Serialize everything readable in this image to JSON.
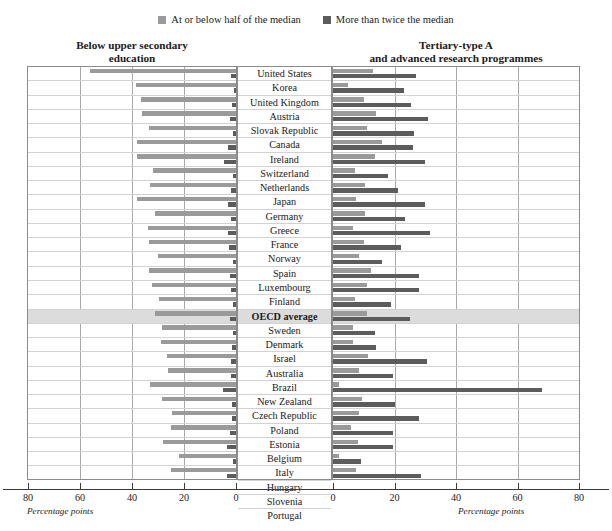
{
  "legend": {
    "items": [
      {
        "label": "At or below half of the median",
        "color": "#9a9a9a",
        "swatch_name": "legend-swatch-light"
      },
      {
        "label": "More than twice the median",
        "color": "#5c5c5c",
        "swatch_name": "legend-swatch-dark"
      }
    ]
  },
  "panels": {
    "left": {
      "title_line1": "Below upper secondary",
      "title_line2": "education",
      "axis_caption": "Percentage points",
      "ticks": [
        "80",
        "60",
        "40",
        "20",
        "0"
      ]
    },
    "right": {
      "title_line1": "Tertiary-type A",
      "title_line2": "and advanced research programmes",
      "axis_caption": "Percentage points",
      "ticks": [
        "0",
        "20",
        "40",
        "60",
        "80"
      ]
    }
  },
  "chart_data": {
    "type": "bar",
    "orientation": "horizontal",
    "layout": "diverging-paired-panels",
    "title": "",
    "xlabel": "Percentage points",
    "ylabel": "",
    "xlim": [
      0,
      80
    ],
    "grid": true,
    "legend_position": "top-center",
    "panel_labels": [
      "Below upper secondary education",
      "Tertiary-type A and advanced research programmes"
    ],
    "series": [
      {
        "name": "At or below half of the median",
        "color": "#9a9a9a"
      },
      {
        "name": "More than twice the median",
        "color": "#5c5c5c"
      }
    ],
    "categories": [
      "United States",
      "Korea",
      "United Kingdom",
      "Austria",
      "Slovak Republic",
      "Canada",
      "Ireland",
      "Switzerland",
      "Netherlands",
      "Japan",
      "Germany",
      "Greece",
      "France",
      "Norway",
      "Spain",
      "Luxembourg",
      "Finland",
      "OECD average",
      "Sweden",
      "Denmark",
      "Israel",
      "Australia",
      "Brazil",
      "New Zealand",
      "Czech Republic",
      "Poland",
      "Estonia",
      "Belgium",
      "Italy",
      "Hungary",
      "Slovenia",
      "Portugal"
    ],
    "highlight_category": "OECD average",
    "rows": [
      {
        "country": "United States",
        "left_low": 56.0,
        "left_high": 2.0,
        "right_low": 13.0,
        "right_high": 27.0
      },
      {
        "country": "Korea",
        "left_low": 38.5,
        "left_high": 0.8,
        "right_low": 5.0,
        "right_high": 23.0
      },
      {
        "country": "United Kingdom",
        "left_low": 36.5,
        "left_high": 1.5,
        "right_low": 10.0,
        "right_high": 25.5
      },
      {
        "country": "Austria",
        "left_low": 36.0,
        "left_high": 2.2,
        "right_low": 14.0,
        "right_high": 31.0
      },
      {
        "country": "Slovak Republic",
        "left_low": 33.5,
        "left_high": 1.0,
        "right_low": 11.0,
        "right_high": 26.5
      },
      {
        "country": "Canada",
        "left_low": 38.0,
        "left_high": 3.2,
        "right_low": 16.0,
        "right_high": 26.0
      },
      {
        "country": "Ireland",
        "left_low": 38.0,
        "left_high": 4.5,
        "right_low": 13.5,
        "right_high": 30.0
      },
      {
        "country": "Switzerland",
        "left_low": 32.0,
        "left_high": 1.2,
        "right_low": 7.0,
        "right_high": 18.0
      },
      {
        "country": "Netherlands",
        "left_low": 33.0,
        "left_high": 2.0,
        "right_low": 10.5,
        "right_high": 21.0
      },
      {
        "country": "Japan",
        "left_low": 38.0,
        "left_high": 3.0,
        "right_low": 7.5,
        "right_high": 30.0
      },
      {
        "country": "Germany",
        "left_low": 31.0,
        "left_high": 2.0,
        "right_low": 10.5,
        "right_high": 23.5
      },
      {
        "country": "Greece",
        "left_low": 34.0,
        "left_high": 3.0,
        "right_low": 6.5,
        "right_high": 31.5
      },
      {
        "country": "France",
        "left_low": 33.5,
        "left_high": 2.8,
        "right_low": 10.0,
        "right_high": 22.0
      },
      {
        "country": "Norway",
        "left_low": 30.0,
        "left_high": 1.0,
        "right_low": 8.5,
        "right_high": 16.0
      },
      {
        "country": "Spain",
        "left_low": 33.5,
        "left_high": 2.5,
        "right_low": 12.5,
        "right_high": 28.0
      },
      {
        "country": "Luxembourg",
        "left_low": 32.5,
        "left_high": 2.0,
        "right_low": 11.0,
        "right_high": 28.0
      },
      {
        "country": "Finland",
        "left_low": 29.5,
        "left_high": 1.0,
        "right_low": 7.0,
        "right_high": 19.0
      },
      {
        "country": "OECD average",
        "left_low": 31.0,
        "left_high": 2.5,
        "right_low": 11.0,
        "right_high": 25.0
      },
      {
        "country": "Sweden",
        "left_low": 28.5,
        "left_high": 1.0,
        "right_low": 6.5,
        "right_high": 13.5
      },
      {
        "country": "Denmark",
        "left_low": 29.0,
        "left_high": 1.5,
        "right_low": 6.5,
        "right_high": 14.0
      },
      {
        "country": "Israel",
        "left_low": 26.5,
        "left_high": 2.0,
        "right_low": 11.5,
        "right_high": 30.5
      },
      {
        "country": "Australia",
        "left_low": 26.0,
        "left_high": 2.0,
        "right_low": 8.5,
        "right_high": 19.5
      },
      {
        "country": "Brazil",
        "left_low": 33.0,
        "left_high": 5.0,
        "right_low": 2.0,
        "right_high": 68.0
      },
      {
        "country": "New Zealand",
        "left_low": 28.5,
        "left_high": 1.5,
        "right_low": 9.5,
        "right_high": 20.0
      },
      {
        "country": "Czech Republic",
        "left_low": 24.5,
        "left_high": 1.5,
        "right_low": 8.5,
        "right_high": 28.0
      },
      {
        "country": "Poland",
        "left_low": 25.0,
        "left_high": 2.5,
        "right_low": 6.0,
        "right_high": 19.5
      },
      {
        "country": "Estonia",
        "left_low": 28.0,
        "left_high": 3.5,
        "right_low": 8.0,
        "right_high": 19.5
      },
      {
        "country": "Belgium",
        "left_low": 22.0,
        "left_high": 1.0,
        "right_low": 2.0,
        "right_high": 9.0
      },
      {
        "country": "Italy",
        "left_low": 25.0,
        "left_high": 3.5,
        "right_low": 7.5,
        "right_high": 28.5
      },
      {
        "country": "Hungary",
        "left_low": 21.5,
        "left_high": 1.0,
        "right_low": 13.5,
        "right_high": 39.0
      },
      {
        "country": "Slovenia",
        "left_low": 18.0,
        "left_high": 1.0,
        "right_low": 5.0,
        "right_high": 31.5
      },
      {
        "country": "Portugal",
        "left_low": 18.5,
        "left_high": 2.5,
        "right_low": 4.0,
        "right_high": 53.0
      }
    ]
  }
}
